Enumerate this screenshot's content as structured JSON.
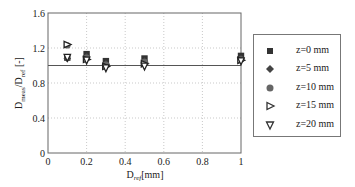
{
  "chart_data": {
    "type": "scatter",
    "title": "",
    "xlabel": "D_ref [mm]",
    "ylabel": "D_meas/D_ref [-]",
    "xlim": [
      0,
      1
    ],
    "ylim": [
      0,
      1.6
    ],
    "xticks": [
      0,
      0.2,
      0.4,
      0.6,
      0.8,
      1
    ],
    "yticks": [
      0,
      0.4,
      0.8,
      1.2,
      1.6
    ],
    "grid": true,
    "grid_style": "dotted",
    "legend_position": "right outside",
    "reference_line": {
      "y": 1.0,
      "style": "solid"
    },
    "x": [
      0.1,
      0.2,
      0.3,
      0.5,
      1.0
    ],
    "series": [
      {
        "name": "z=0 mm",
        "marker": "square",
        "fill": "#333333",
        "values": [
          1.09,
          1.13,
          1.05,
          1.08,
          1.11
        ]
      },
      {
        "name": "z=5 mm",
        "marker": "diamond",
        "fill": "#444444",
        "values": [
          1.08,
          1.1,
          1.02,
          1.05,
          1.08
        ]
      },
      {
        "name": "z=10 mm",
        "marker": "circle",
        "fill": "#666666",
        "values": [
          1.23,
          1.09,
          1.01,
          1.04,
          1.07
        ]
      },
      {
        "name": "z=15 mm",
        "marker": "triangle-right",
        "fill": "#ffffff",
        "values": [
          1.24,
          1.07,
          0.99,
          1.02,
          1.06
        ]
      },
      {
        "name": "z=20 mm",
        "marker": "triangle-down",
        "fill": "#ffffff",
        "values": [
          1.09,
          1.06,
          0.97,
          0.99,
          1.05
        ]
      }
    ]
  },
  "axes": {
    "xlabel_main": "D",
    "xlabel_sub": "ref",
    "xlabel_unit": "[mm]",
    "ylabel_main1": "D",
    "ylabel_sub1": "meas",
    "ylabel_main2": "/D",
    "ylabel_sub2": "ref",
    "ylabel_unit": " [-]",
    "xtick_labels": [
      "0",
      "0.2",
      "0.4",
      "0.6",
      "0.8",
      "1"
    ],
    "ytick_labels": [
      "0",
      "0.4",
      "0.8",
      "1.2",
      "1.6"
    ]
  },
  "legend": {
    "items": [
      {
        "label": "z=0 mm",
        "marker": "square"
      },
      {
        "label": "z=5 mm",
        "marker": "diamond"
      },
      {
        "label": "z=10 mm",
        "marker": "circle"
      },
      {
        "label": "z=15 mm",
        "marker": "triangle-right"
      },
      {
        "label": "z=20 mm",
        "marker": "triangle-down"
      }
    ]
  }
}
